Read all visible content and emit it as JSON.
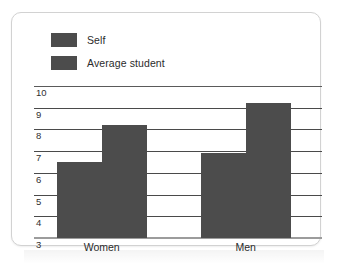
{
  "card": {
    "title": ""
  },
  "legend": {
    "position": "top-left",
    "items": [
      {
        "label": "Self",
        "color": "#4c4c4c",
        "icon": "legend-swatch"
      },
      {
        "label": "Average student",
        "color": "#4c4c4c",
        "icon": "legend-swatch"
      }
    ]
  },
  "chart_data": {
    "type": "bar",
    "title": "",
    "xlabel": "",
    "ylabel": "",
    "categories": [
      "Women",
      "Men"
    ],
    "series": [
      {
        "name": "Self",
        "values": [
          6.5,
          6.9
        ]
      },
      {
        "name": "Average student",
        "values": [
          8.2,
          9.2
        ]
      }
    ],
    "ylim": [
      3,
      10
    ],
    "yticks": [
      3,
      4,
      5,
      6,
      7,
      8,
      9,
      10
    ],
    "ytick_labels": [
      "3",
      "4",
      "5",
      "6",
      "7",
      "8",
      "9",
      "10"
    ],
    "grid": true,
    "grid_axis": "y",
    "legend_position": "top-left",
    "bar_color": "#4c4c4c",
    "background": "#ffffff"
  }
}
